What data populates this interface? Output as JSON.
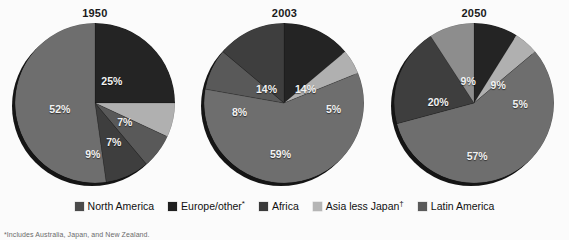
{
  "chart_data": [
    {
      "type": "pie",
      "title": "1950",
      "categories": [
        "North America",
        "Europe/other*",
        "Africa",
        "Asia less Japan†",
        "Latin America"
      ],
      "values": [
        null,
        25,
        7,
        52,
        null
      ],
      "slices": [
        {
          "label": "25%",
          "value": 25,
          "category": "Europe/other*",
          "color": "#242424",
          "start_deg": 0,
          "end_deg": 90,
          "label_x": 97,
          "label_y": 58
        },
        {
          "label": "7%",
          "value": 7,
          "category": "Asia less Japan†",
          "color": "#b0b0b0",
          "start_deg": 90,
          "end_deg": 115,
          "label_x": 110,
          "label_y": 99
        },
        {
          "label": "7%",
          "value": 7,
          "category": "Latin America",
          "color": "#595959",
          "start_deg": 115,
          "end_deg": 140,
          "label_x": 99,
          "label_y": 119
        },
        {
          "label": "9%",
          "value": 9,
          "category": "Africa",
          "color": "#3e3e3e",
          "start_deg": 140,
          "end_deg": 172,
          "label_x": 78,
          "label_y": 131
        },
        {
          "label": "52%",
          "value": 52,
          "category": "North America",
          "color": "#6e6e6e",
          "start_deg": 172,
          "end_deg": 360,
          "label_x": 45,
          "label_y": 86
        }
      ],
      "ylim": [
        0,
        100
      ],
      "grid": false,
      "legend_position": "bottom"
    },
    {
      "type": "pie",
      "title": "2003",
      "categories": [
        "North America",
        "Europe/other*",
        "Africa",
        "Asia less Japan†",
        "Latin America"
      ],
      "values": [
        14,
        14,
        8,
        59,
        5
      ],
      "slices": [
        {
          "label": "14%",
          "value": 14,
          "category": "Europe/other*",
          "color": "#242424",
          "start_deg": 0,
          "end_deg": 50,
          "label_x": 101,
          "label_y": 66
        },
        {
          "label": "5%",
          "value": 5,
          "category": "Asia less Japan†",
          "color": "#b0b0b0",
          "start_deg": 50,
          "end_deg": 68,
          "label_x": 129,
          "label_y": 86
        },
        {
          "label": "59%",
          "value": 59,
          "category": "North America",
          "color": "#6e6e6e",
          "start_deg": 68,
          "end_deg": 280,
          "label_x": 76,
          "label_y": 131
        },
        {
          "label": "8%",
          "value": 8,
          "category": "Latin America",
          "color": "#595959",
          "start_deg": 280,
          "end_deg": 310,
          "label_x": 35,
          "label_y": 89
        },
        {
          "label": "14%",
          "value": 14,
          "category": "Africa",
          "color": "#3e3e3e",
          "start_deg": 310,
          "end_deg": 360,
          "label_x": 62,
          "label_y": 66
        }
      ],
      "ylim": [
        0,
        100
      ],
      "grid": false,
      "legend_position": "bottom"
    },
    {
      "type": "pie",
      "title": "2050",
      "categories": [
        "North America",
        "Europe/other*",
        "Africa",
        "Asia less Japan†",
        "Latin America"
      ],
      "values": [
        9,
        9,
        20,
        57,
        5
      ],
      "slices": [
        {
          "label": "9%",
          "value": 9,
          "category": "Europe/other*",
          "color": "#242424",
          "start_deg": 0,
          "end_deg": 32,
          "label_x": 104,
          "label_y": 62
        },
        {
          "label": "5%",
          "value": 5,
          "category": "Asia less Japan†",
          "color": "#b0b0b0",
          "start_deg": 32,
          "end_deg": 50,
          "label_x": 126,
          "label_y": 81
        },
        {
          "label": "57%",
          "value": 57,
          "category": "North America",
          "color": "#6e6e6e",
          "start_deg": 50,
          "end_deg": 255,
          "label_x": 83,
          "label_y": 133
        },
        {
          "label": "20%",
          "value": 20,
          "category": "Africa",
          "color": "#3e3e3e",
          "start_deg": 255,
          "end_deg": 327,
          "label_x": 44,
          "label_y": 79
        },
        {
          "label": "9%",
          "value": 9,
          "category": "Latin America",
          "color": "#8d8d8d",
          "start_deg": 327,
          "end_deg": 360,
          "label_x": 74,
          "label_y": 58
        }
      ],
      "ylim": [
        0,
        100
      ],
      "grid": false,
      "legend_position": "bottom"
    }
  ],
  "legend": {
    "items": [
      {
        "label": "North America",
        "color": "#4a4a4a"
      },
      {
        "label": "Europe/other",
        "sup": "*",
        "color": "#1f1f1f"
      },
      {
        "label": "Africa",
        "color": "#3a3a3a"
      },
      {
        "label": "Asia less Japan",
        "sup": "†",
        "color": "#b5b5b5"
      },
      {
        "label": "Latin America",
        "color": "#5a5a5a"
      }
    ]
  },
  "footnote": {
    "text": "*Includes Australia, Japan, and New Zealand."
  },
  "colors": {
    "background": "#fbfbfb",
    "text": "#101010",
    "slice_label": "#f2f2f2",
    "pie_shadow": "#151515"
  }
}
